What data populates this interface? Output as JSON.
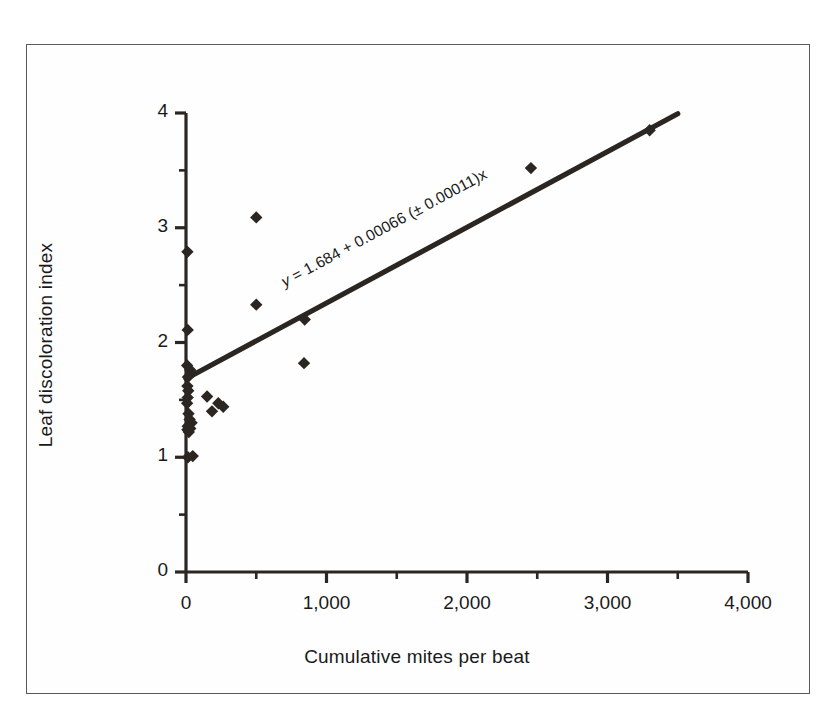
{
  "figure": {
    "border_color": "#5a5a55",
    "background": "#ffffff",
    "ink_color": "#2b2622"
  },
  "chart_data": {
    "type": "scatter",
    "title": "",
    "xlabel": "Cumulative mites per beat",
    "ylabel": "Leaf discoloration index",
    "xlim": [
      0,
      4000
    ],
    "ylim": [
      0,
      4
    ],
    "grid": false,
    "legend": "none",
    "xticks": [
      0,
      1000,
      2000,
      3000,
      4000
    ],
    "xtick_labels": [
      "0",
      "1,000",
      "2,000",
      "3,000",
      "4,000"
    ],
    "x_minor_ticks": [
      500,
      1500,
      2500,
      3500
    ],
    "yticks": [
      0,
      1,
      2,
      3,
      4
    ],
    "ytick_labels": [
      "0",
      "1",
      "2",
      "3",
      "4"
    ],
    "y_minor_ticks": [
      0.5,
      1.5,
      2.5,
      3.5
    ],
    "marker": "diamond",
    "marker_color": "#2b2622",
    "points": [
      {
        "x": 10,
        "y": 2.79
      },
      {
        "x": 12,
        "y": 2.11
      },
      {
        "x": 8,
        "y": 1.8
      },
      {
        "x": 30,
        "y": 1.76
      },
      {
        "x": 14,
        "y": 1.7
      },
      {
        "x": 10,
        "y": 1.62
      },
      {
        "x": 16,
        "y": 1.58
      },
      {
        "x": 12,
        "y": 1.52
      },
      {
        "x": 8,
        "y": 1.47
      },
      {
        "x": 150,
        "y": 1.53
      },
      {
        "x": 230,
        "y": 1.47
      },
      {
        "x": 185,
        "y": 1.4
      },
      {
        "x": 265,
        "y": 1.44
      },
      {
        "x": 18,
        "y": 1.38
      },
      {
        "x": 26,
        "y": 1.33
      },
      {
        "x": 40,
        "y": 1.3
      },
      {
        "x": 12,
        "y": 1.27
      },
      {
        "x": 30,
        "y": 1.25
      },
      {
        "x": 20,
        "y": 1.22
      },
      {
        "x": 10,
        "y": 1.24
      },
      {
        "x": 14,
        "y": 1.0
      },
      {
        "x": 48,
        "y": 1.01
      },
      {
        "x": 500,
        "y": 3.09
      },
      {
        "x": 500,
        "y": 2.33
      },
      {
        "x": 845,
        "y": 2.2
      },
      {
        "x": 840,
        "y": 1.82
      },
      {
        "x": 2455,
        "y": 3.52
      },
      {
        "x": 3300,
        "y": 3.85
      }
    ],
    "regression_line": {
      "intercept": 1.684,
      "slope": 0.00066,
      "slope_error": 0.00011,
      "x_start": 0,
      "x_end": 3500,
      "equation_text": "y = 1.684 + 0.00066 (± 0.00011)x",
      "equation_prefix": "y",
      "equation_rest": " = 1.684 + 0.00066 (± 0.00011)x",
      "color": "#2b2622"
    }
  }
}
